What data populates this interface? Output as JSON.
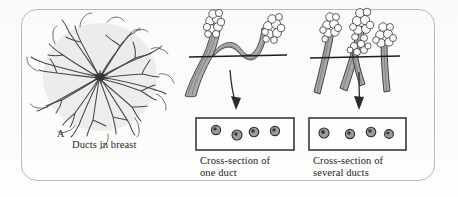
{
  "figure": {
    "type": "anatomical-illustration",
    "panel_a": {
      "letter": "A",
      "caption": "Ducts in breast",
      "icon": "breast-duct-tree-icon"
    },
    "panel_middle": {
      "caption": "Cross-section of\none duct",
      "icon": "single-duct-icon",
      "duct_count": 1,
      "lobule_count": 2,
      "cut_line": "horizontal",
      "arrow": "down-arrow-icon",
      "cross_section_circles": 4
    },
    "panel_right": {
      "caption": "Cross-section of\nseveral ducts",
      "icon": "several-ducts-icon",
      "duct_count": 3,
      "lobule_count": 4,
      "cut_line": "horizontal",
      "arrow": "down-arrow-icon",
      "cross_section_circles": 4
    },
    "colors": {
      "ink": "#2b2b2b",
      "frame": "#b9b9b9",
      "fill_light": "#cfcfcf",
      "fill_mid": "#9a9a9a",
      "paper": "#fdfdfc"
    }
  }
}
